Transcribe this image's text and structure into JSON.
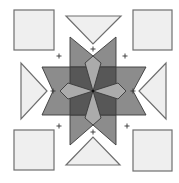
{
  "diagram": {
    "title": "",
    "type": "quilt-block-layout",
    "colors": {
      "background": "#ffffff",
      "outer_piece_fill": "#efefef",
      "outer_piece_stroke": "#6e6e6e",
      "star_arm_fill": "#8c8c8c",
      "center_square_fill": "#575757",
      "kite_fill": "#ababab",
      "outline": "#3a3a3a",
      "marker": "#333333"
    },
    "corner_squares": [
      {
        "name": "top-left",
        "x": 14,
        "y": 10,
        "w": 40,
        "h": 40
      },
      {
        "name": "top-right",
        "x": 133,
        "y": 10,
        "w": 39,
        "h": 40
      },
      {
        "name": "bottom-left",
        "x": 14,
        "y": 130,
        "w": 40,
        "h": 40
      },
      {
        "name": "bottom-right",
        "x": 133,
        "y": 130,
        "w": 39,
        "h": 41
      }
    ],
    "side_triangles": [
      {
        "name": "top",
        "points": "66,16 121,16 93,44"
      },
      {
        "name": "bottom",
        "points": "66,165 120,165 93,137"
      },
      {
        "name": "left",
        "points": "21,63 21,119 47,91"
      },
      {
        "name": "right",
        "points": "166,63 166,119 139,91"
      }
    ],
    "star": {
      "vertical_arm": "70,37 93,56 116,37 116,145 93,125 70,145",
      "horizontal_arm": "42,67 146,67 133,91 146,115 42,115 53,91",
      "center_square": "70,67 116,67 116,115 70,115",
      "kites": [
        {
          "name": "top",
          "points": "93,56 101,63 93,91 85,63"
        },
        {
          "name": "bottom",
          "points": "93,125 101,118 93,91 85,118"
        },
        {
          "name": "left",
          "points": "60,91 68,83 93,91 68,99"
        },
        {
          "name": "right",
          "points": "126,91 118,83 93,91 118,99"
        }
      ],
      "center": {
        "x": 93,
        "y": 91
      }
    },
    "markers": [
      {
        "x": 59,
        "y": 56
      },
      {
        "x": 93,
        "y": 49
      },
      {
        "x": 125,
        "y": 56
      },
      {
        "x": 53,
        "y": 91
      },
      {
        "x": 133,
        "y": 91
      },
      {
        "x": 59,
        "y": 126
      },
      {
        "x": 93,
        "y": 132
      },
      {
        "x": 127,
        "y": 126
      }
    ],
    "marker_glyph": "+"
  }
}
